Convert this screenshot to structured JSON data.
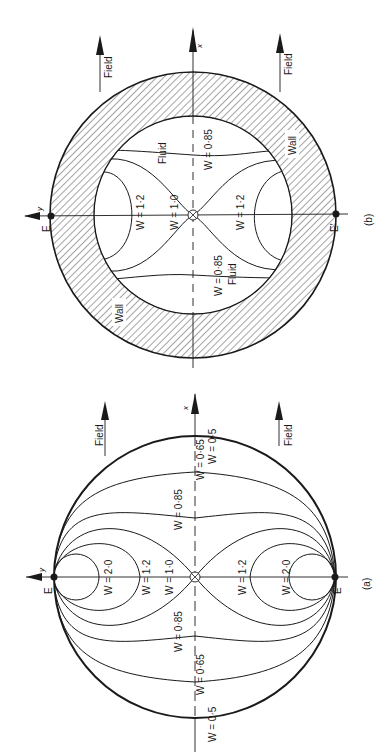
{
  "figure": {
    "colors": {
      "ink": "#1a1a1a",
      "background": "#ffffff"
    },
    "panel_b": {
      "caption": "(b)",
      "axis_x_label": "x",
      "axis_y_label": "y",
      "point_top": "E",
      "point_bottom": "E'",
      "field_label_top": "Field",
      "field_label_bottom": "Field",
      "wall_label_1": "Wall",
      "wall_label_2": "Wall",
      "fluid_label_1": "Fluid",
      "fluid_label_2": "Fluid",
      "contours": {
        "w085_upper": "W = 0·85",
        "w085_lower": "W = 0·85",
        "w12_left": "W = 1·2",
        "w10": "W = 1·0",
        "w12_right": "W = 1·2"
      }
    },
    "panel_a": {
      "caption": "(a)",
      "axis_x_label": "x",
      "axis_y_label": "y",
      "point_top": "E",
      "point_bottom": "E'",
      "field_label_top": "Field",
      "field_label_bottom": "Field",
      "contours": {
        "w05_left": "W = 0·5",
        "w065_left": "W = 0·65",
        "w085_left": "W = 0·85",
        "w10": "W = 1·0",
        "w12_left": "W = 1·2",
        "w20_left": "W = 2·0",
        "w12_right": "W = 1·2",
        "w20_right": "W = 2·0",
        "w085_right": "W = 0·85",
        "w065_right": "W = 0·65",
        "w05_right": "W = 0·5"
      }
    }
  }
}
